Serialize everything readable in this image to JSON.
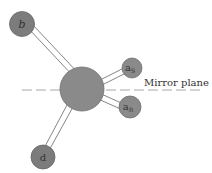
{
  "diagram": {
    "atoms": {
      "center": {
        "label": ""
      },
      "b": {
        "label": "b"
      },
      "d": {
        "label": "d"
      },
      "aS": {
        "label": "a",
        "sub": "S"
      },
      "aR": {
        "label": "a",
        "sub": "R"
      }
    },
    "mirror_plane_label": "Mirror plane",
    "colors": {
      "atom_fill": "#8a8a8a",
      "atom_stroke": "#6f6f6f",
      "bond_stroke": "#777777",
      "mirror_line": "#a8a8a8"
    }
  }
}
